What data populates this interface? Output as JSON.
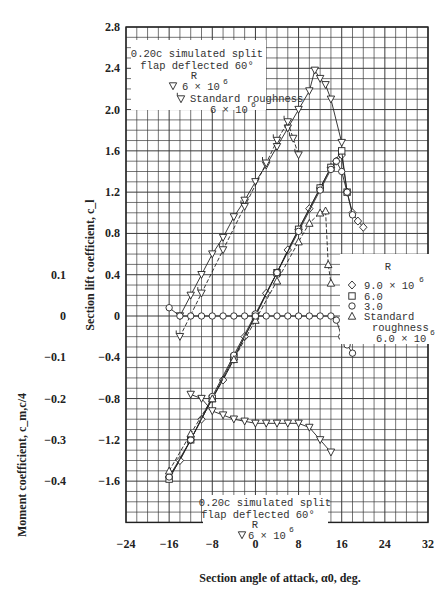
{
  "chart_data": {
    "type": "line",
    "title": "",
    "xlabel": "Section angle of attack, α0, deg.",
    "ylabel_left_outer": "Moment coefficient, c_m,c/4",
    "ylabel_left_inner": "Section lift coefficient, c_l",
    "xlim": [
      -24,
      32
    ],
    "ylim": [
      -2.0,
      2.8
    ],
    "x_ticks": [
      "-24",
      "-16",
      "-8",
      "0",
      "8",
      "16",
      "24",
      "32"
    ],
    "y_ticks_lift": [
      "2.8",
      "2.4",
      "2.0",
      "1.6",
      "1.2",
      "0.8",
      "0.4",
      "0",
      "-0.4",
      "-0.8",
      "-1.2",
      "-1.6"
    ],
    "y_ticks_moment": [
      "0.1",
      "0",
      "-0.1",
      "-0.2",
      "-0.3",
      "-0.4"
    ],
    "grid": true,
    "legends": [
      {
        "position": "top-left",
        "title": "0.20c simulated split flap deflected 60°",
        "header": "R",
        "entries": [
          {
            "marker": "inverted-triangle",
            "label": "6 × 10^6"
          },
          {
            "marker": "flagged-inverted-triangle",
            "label": "Standard roughness 6 × 10^6"
          }
        ]
      },
      {
        "position": "right",
        "header": "R",
        "entries": [
          {
            "marker": "diamond",
            "label": "9.0 × 10^6"
          },
          {
            "marker": "square",
            "label": "6.0"
          },
          {
            "marker": "circle",
            "label": "3.0"
          },
          {
            "marker": "triangle",
            "label": "Standard roughness 6.0 × 10^6"
          }
        ]
      },
      {
        "position": "bottom-center",
        "title": "0.20c simulated split flap deflected 60°",
        "header": "R",
        "entries": [
          {
            "marker": "inverted-triangle",
            "label": "6 × 10^6"
          }
        ]
      }
    ],
    "series": [
      {
        "name": "Flap 60°, R=6×10^6 (lift)",
        "marker": "inverted-triangle",
        "x": [
          -14,
          -12,
          -10,
          -8,
          -6,
          -4,
          -2,
          0,
          2,
          4,
          6,
          8,
          10,
          11,
          12,
          13,
          14,
          16
        ],
        "y": [
          0.0,
          0.2,
          0.4,
          0.6,
          0.76,
          0.96,
          1.12,
          1.3,
          1.46,
          1.64,
          1.82,
          2.0,
          2.18,
          2.38,
          2.3,
          2.24,
          2.1,
          1.68
        ]
      },
      {
        "name": "Flap 60°, standard roughness (lift)",
        "marker": "flagged-inverted-triangle",
        "x": [
          -14,
          -10,
          -6,
          -2,
          2,
          4,
          6,
          7,
          8
        ],
        "y": [
          -0.2,
          0.22,
          0.64,
          1.06,
          1.48,
          1.7,
          1.88,
          1.72,
          1.56
        ]
      },
      {
        "name": "Plain, R=9.0×10^6 (lift)",
        "marker": "diamond",
        "x": [
          -16,
          -14,
          -12,
          -10,
          -8,
          -6,
          -4,
          -2,
          0,
          2,
          4,
          6,
          8,
          10,
          12,
          14,
          15,
          16,
          17,
          18,
          19,
          20
        ],
        "y": [
          -1.56,
          -1.4,
          -1.2,
          -1.0,
          -0.8,
          -0.62,
          -0.42,
          -0.2,
          0.0,
          0.22,
          0.42,
          0.64,
          0.84,
          1.04,
          1.24,
          1.44,
          1.5,
          1.56,
          1.2,
          1.0,
          0.92,
          0.86
        ]
      },
      {
        "name": "Plain, R=6.0×10^6 (lift)",
        "marker": "square",
        "x": [
          -16,
          -12,
          -8,
          -4,
          0,
          4,
          8,
          12,
          14,
          16,
          17
        ],
        "y": [
          -1.58,
          -1.2,
          -0.8,
          -0.4,
          0.0,
          0.42,
          0.84,
          1.24,
          1.44,
          1.6,
          1.2
        ]
      },
      {
        "name": "Plain, R=3.0×10^6 (lift)",
        "marker": "circle",
        "x": [
          -16,
          -12,
          -8,
          -4,
          0,
          4,
          8,
          12,
          14,
          15,
          16,
          17,
          18
        ],
        "y": [
          -1.56,
          -1.2,
          -0.78,
          -0.38,
          0.02,
          0.42,
          0.82,
          1.22,
          1.42,
          1.5,
          1.4,
          1.2,
          0.98
        ]
      },
      {
        "name": "Plain, standard roughness (lift)",
        "marker": "triangle",
        "x": [
          -16,
          -12,
          -8,
          -4,
          0,
          4,
          8,
          10,
          12,
          13,
          13.5,
          14
        ],
        "y": [
          -1.5,
          -1.14,
          -0.8,
          -0.42,
          -0.04,
          0.34,
          0.72,
          0.9,
          1.0,
          1.02,
          0.5,
          0.32
        ]
      },
      {
        "name": "Plain (moment c_m,c/4)",
        "marker": "circle",
        "x": [
          -16,
          -14,
          -12,
          -10,
          -8,
          -6,
          -4,
          -2,
          0,
          2,
          4,
          6,
          8,
          10,
          12,
          14,
          15,
          16,
          17,
          18
        ],
        "y": [
          0.02,
          0.0,
          0.0,
          0.0,
          0.0,
          0.0,
          0.0,
          0.0,
          0.0,
          0.0,
          0.0,
          0.0,
          0.0,
          0.0,
          0.0,
          0.0,
          -0.01,
          -0.05,
          -0.07,
          -0.09
        ]
      },
      {
        "name": "Flap 60°, R=6×10^6 (moment c_m,c/4)",
        "marker": "inverted-triangle",
        "x": [
          -12,
          -10,
          -8,
          -6,
          -4,
          -2,
          0,
          2,
          4,
          6,
          8,
          10,
          12,
          14
        ],
        "y": [
          -0.19,
          -0.2,
          -0.23,
          -0.24,
          -0.25,
          -0.255,
          -0.26,
          -0.26,
          -0.26,
          -0.26,
          -0.26,
          -0.27,
          -0.3,
          -0.33
        ]
      }
    ]
  }
}
